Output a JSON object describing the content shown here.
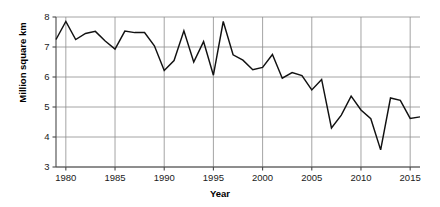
{
  "chart_data": {
    "type": "line",
    "title": "",
    "xlabel": "Year",
    "ylabel": "Million square km",
    "xlim": [
      1979,
      2016
    ],
    "ylim": [
      3,
      8
    ],
    "xticks": [
      1980,
      1985,
      1990,
      1995,
      2000,
      2005,
      2010,
      2015
    ],
    "yticks": [
      3,
      4,
      5,
      6,
      7,
      8
    ],
    "grid": true,
    "legend": "none",
    "line_color": "#111111",
    "x": [
      1979,
      1980,
      1981,
      1982,
      1983,
      1984,
      1985,
      1986,
      1987,
      1988,
      1989,
      1990,
      1991,
      1992,
      1993,
      1994,
      1995,
      1996,
      1997,
      1998,
      1999,
      2000,
      2001,
      2002,
      2003,
      2004,
      2005,
      2006,
      2007,
      2008,
      2009,
      2010,
      2011,
      2012,
      2013,
      2014,
      2015,
      2016
    ],
    "values": [
      7.25,
      7.85,
      7.25,
      7.45,
      7.52,
      7.2,
      6.93,
      7.53,
      7.48,
      7.48,
      7.04,
      6.22,
      6.55,
      7.54,
      6.5,
      7.18,
      6.06,
      7.85,
      6.74,
      6.56,
      6.24,
      6.32,
      6.75,
      5.96,
      6.15,
      6.05,
      5.57,
      5.92,
      4.3,
      4.73,
      5.36,
      4.9,
      4.61,
      3.57,
      5.3,
      5.22,
      4.62,
      4.67
    ],
    "series": [
      {
        "name": "Sea ice extent",
        "values": [
          7.25,
          7.85,
          7.25,
          7.45,
          7.52,
          7.2,
          6.93,
          7.53,
          7.48,
          7.48,
          7.04,
          6.22,
          6.55,
          7.54,
          6.5,
          7.18,
          6.06,
          7.85,
          6.74,
          6.56,
          6.24,
          6.32,
          6.75,
          5.96,
          6.15,
          6.05,
          5.57,
          5.92,
          4.3,
          4.73,
          5.36,
          4.9,
          4.61,
          3.57,
          5.3,
          5.22,
          4.62,
          4.67
        ]
      }
    ]
  },
  "axes": {
    "y_tick_labels": [
      "8",
      "7",
      "6",
      "5",
      "4",
      "3"
    ],
    "x_tick_labels": [
      "1980",
      "1985",
      "1990",
      "1995",
      "2000",
      "2005",
      "2010",
      "2015"
    ],
    "y_axis_title": "Million square km",
    "x_axis_title": "Year"
  }
}
